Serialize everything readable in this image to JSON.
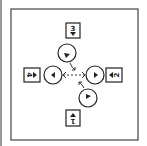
{
  "diagram": {
    "frame": {
      "x": 11,
      "y": 9,
      "width": 127,
      "height": 131,
      "stroke": "#444444"
    },
    "colors": {
      "line": "#222222",
      "edge": "#9a9a9a",
      "background": "#ffffff"
    },
    "boxes": [
      {
        "id": "top",
        "label": "3",
        "arrow": "down",
        "x": 66,
        "y": 23,
        "w": 14,
        "h": 15,
        "rotation": 0
      },
      {
        "id": "left",
        "label": "4",
        "arrow": "right",
        "x": 24,
        "y": 68,
        "w": 16,
        "h": 14,
        "rotation": 90
      },
      {
        "id": "right",
        "label": "2",
        "arrow": "left",
        "x": 106,
        "y": 68,
        "w": 16,
        "h": 14,
        "rotation": -90
      },
      {
        "id": "bottom",
        "label": "1",
        "arrow": "up",
        "x": 66,
        "y": 110,
        "w": 14,
        "h": 16,
        "rotation": 180
      }
    ],
    "circles": [
      {
        "id": "top",
        "cx": 67,
        "cy": 53,
        "r": 9,
        "pointer": "down-left"
      },
      {
        "id": "left",
        "cx": 53,
        "cy": 75,
        "r": 9,
        "pointer": "left"
      },
      {
        "id": "right",
        "cx": 95,
        "cy": 75,
        "r": 9,
        "pointer": "right"
      },
      {
        "id": "bottom",
        "cx": 88,
        "cy": 98,
        "r": 9,
        "pointer": "up-right"
      }
    ],
    "connectors": [
      {
        "from": "left-circle",
        "to": "right-circle",
        "style": "dashed",
        "heads": "both"
      },
      {
        "from": "top-circle",
        "to": "center",
        "style": "solid-curved",
        "heads": "end"
      },
      {
        "from": "bottom-circle",
        "to": "center",
        "style": "solid-curved",
        "heads": "end"
      }
    ]
  }
}
